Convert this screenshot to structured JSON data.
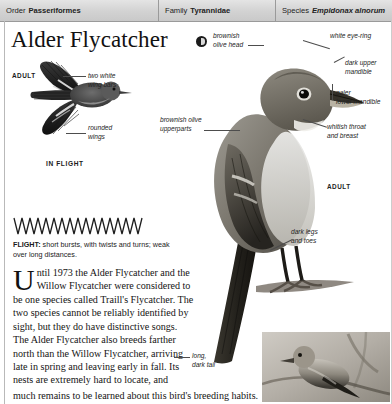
{
  "header": {
    "order": {
      "label": "Order",
      "value": "Passeriformes"
    },
    "family": {
      "label": "Family",
      "value": "Tyrannidae"
    },
    "species": {
      "label": "Species",
      "value": "Empidonax alnorum"
    }
  },
  "title": "Alder Flycatcher",
  "sound_badge": "sound-icon",
  "flight_panel": {
    "adult_label": "ADULT",
    "in_flight_label": "IN FLIGHT",
    "wing_bars_label": "two white\nwing bars",
    "wing_bars_line1": "two white",
    "wing_bars_line2": "wing bars",
    "rounded_wings_line1": "rounded",
    "rounded_wings_line2": "wings",
    "flight_caption_title": "FLIGHT:",
    "flight_caption_text": " short bursts, with twists and turns; weak over long distances."
  },
  "body": {
    "dropcap": "U",
    "paragraph": "ntil 1973 the Alder Flycatcher and the Willow Flycatcher were considered to be one species called Traill's Flycatcher. The two species cannot be reliably identified by sight, but they do have distinctive songs. The Alder Flycatcher also breeds farther north than the Willow Flycatcher, arriving late in spring and leaving early in fall. Its nests are extremely hard to locate, and",
    "last_line": "much remains to be learned about this bird's breeding habits."
  },
  "annotations": {
    "brownish_olive_head_1": "brownish",
    "brownish_olive_head_2": "olive head",
    "white_eye_ring": "white eye-ring",
    "dark_upper_mandible_1": "dark upper",
    "dark_upper_mandible_2": "mandible",
    "paler_lower_mandible_1": "paler",
    "paler_lower_mandible_2": "lower mandible",
    "whitish_throat_1": "whitish throat",
    "whitish_throat_2": "and breast",
    "brownish_olive_upperparts_1": "brownish olive",
    "brownish_olive_upperparts_2": "upperparts",
    "adult_main": "ADULT",
    "dark_legs_1": "dark legs",
    "dark_legs_2": "and toes",
    "long_dark_tail_1": "long,",
    "long_dark_tail_2": "dark tail"
  },
  "colors": {
    "header_bg": "#d8d8d8",
    "header_border": "#9a9a9a",
    "text": "#141414",
    "label": "#242424",
    "leader": "#4d4d4d"
  }
}
